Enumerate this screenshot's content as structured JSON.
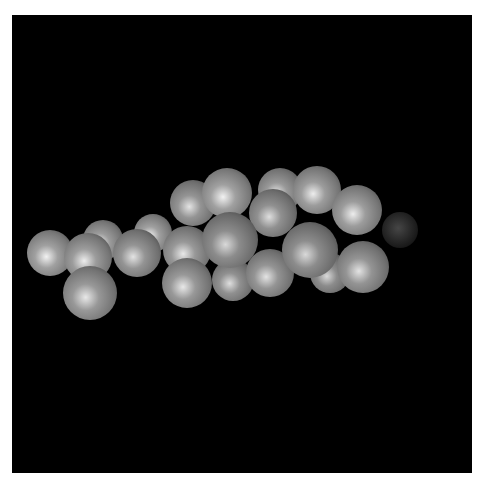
{
  "image": {
    "title": "Space-filling molecular model",
    "background_color": "#000000",
    "border_color": "#ffffff",
    "atom_colors": {
      "carbon_hydrogen": "#9a9a9a",
      "oxygen": "#3a3a3a"
    },
    "atoms": [
      {
        "x": 103,
        "y": 240,
        "r": 20,
        "shade": 0.78,
        "type": "light"
      },
      {
        "x": 153,
        "y": 233,
        "r": 19,
        "shade": 0.8,
        "type": "light"
      },
      {
        "x": 50,
        "y": 253,
        "r": 23,
        "shade": 0.8,
        "type": "light"
      },
      {
        "x": 137,
        "y": 253,
        "r": 24,
        "shade": 0.74,
        "type": "light"
      },
      {
        "x": 88,
        "y": 257,
        "r": 24,
        "shade": 0.78,
        "type": "light"
      },
      {
        "x": 90,
        "y": 293,
        "r": 27,
        "shade": 0.76,
        "type": "light"
      },
      {
        "x": 193,
        "y": 203,
        "r": 23,
        "shade": 0.74,
        "type": "light"
      },
      {
        "x": 280,
        "y": 190,
        "r": 22,
        "shade": 0.76,
        "type": "light"
      },
      {
        "x": 317,
        "y": 190,
        "r": 24,
        "shade": 0.78,
        "type": "light"
      },
      {
        "x": 227,
        "y": 193,
        "r": 25,
        "shade": 0.8,
        "type": "light"
      },
      {
        "x": 187,
        "y": 250,
        "r": 24,
        "shade": 0.76,
        "type": "light"
      },
      {
        "x": 233,
        "y": 280,
        "r": 21,
        "shade": 0.72,
        "type": "light"
      },
      {
        "x": 270,
        "y": 273,
        "r": 24,
        "shade": 0.74,
        "type": "light"
      },
      {
        "x": 330,
        "y": 273,
        "r": 20,
        "shade": 0.7,
        "type": "light"
      },
      {
        "x": 187,
        "y": 283,
        "r": 25,
        "shade": 0.76,
        "type": "light"
      },
      {
        "x": 273,
        "y": 213,
        "r": 24,
        "shade": 0.72,
        "type": "light"
      },
      {
        "x": 363,
        "y": 267,
        "r": 26,
        "shade": 0.74,
        "type": "light"
      },
      {
        "x": 357,
        "y": 210,
        "r": 25,
        "shade": 0.78,
        "type": "light"
      },
      {
        "x": 400,
        "y": 230,
        "r": 18,
        "shade": 0.28,
        "type": "dark"
      },
      {
        "x": 230,
        "y": 240,
        "r": 28,
        "shade": 0.7,
        "type": "light"
      },
      {
        "x": 310,
        "y": 250,
        "r": 28,
        "shade": 0.7,
        "type": "light"
      }
    ]
  }
}
